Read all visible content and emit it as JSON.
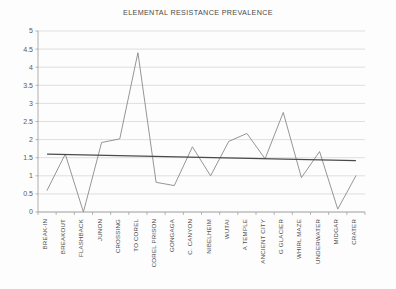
{
  "chart_data": {
    "type": "line",
    "title": "ELEMENTAL RESISTANCE PREVALENCE",
    "xlabel": "",
    "ylabel": "",
    "ylim": [
      0,
      5
    ],
    "ytick_step": 0.5,
    "ytick_labels": [
      "0",
      "0.5",
      "1",
      "1.5",
      "2",
      "2.5",
      "3",
      "3.5",
      "4",
      "4.5",
      "5"
    ],
    "grid": "horizontal",
    "legend": "none",
    "categories": [
      "BREAK-IN",
      "BREAKOUT",
      "FLASHBACK",
      "JUNON",
      "CROSSING",
      "TO COREL",
      "COREL PRISON",
      "GONGAGA",
      "C. CANYON",
      "NIBELHEIM",
      "WUTAI",
      "A TEMPLE",
      "ANCIENT CITY",
      "G GLACIER",
      "WHIRL MAZE",
      "UNDERWATER",
      "MIDGAR",
      "CRATER"
    ],
    "series": [
      {
        "name": "Elemental resistance prevalence",
        "color": "#8a8a8a",
        "values": [
          0.6,
          1.6,
          0.0,
          1.92,
          2.02,
          4.4,
          0.82,
          0.73,
          1.8,
          1.0,
          1.95,
          2.17,
          1.47,
          2.75,
          0.95,
          1.67,
          0.08,
          1.0
        ]
      }
    ],
    "trendline": {
      "name": "Linear trend",
      "color": "#4a4a4a",
      "start_value": 1.6,
      "end_value": 1.42
    },
    "axis_color": "#9a9a9a",
    "grid_color": "#d2d2d2"
  }
}
